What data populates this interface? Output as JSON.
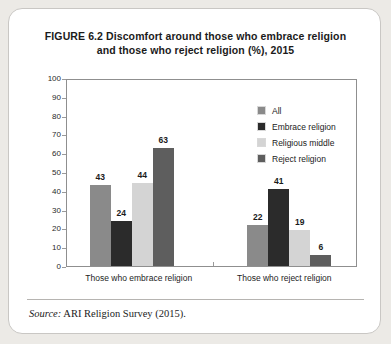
{
  "figure": {
    "title_line1": "FIGURE 6.2  Discomfort around those who embrace religion",
    "title_line2": "and those who reject religion (%), 2015",
    "source_label": "Source:",
    "source_text": " ARI Religion Survey (2015)."
  },
  "chart_data": {
    "type": "bar",
    "title": "FIGURE 6.2  Discomfort around those who embrace religion and those who reject religion (%), 2015",
    "xlabel": "",
    "ylabel": "",
    "ylim": [
      0,
      100
    ],
    "yticks": [
      0,
      10,
      20,
      30,
      40,
      50,
      60,
      70,
      80,
      90,
      100
    ],
    "grid": false,
    "legend_position": "inside-top-right",
    "categories": [
      "Those who embrace religion",
      "Those who reject religion"
    ],
    "series": [
      {
        "name": "All",
        "color": "#8a8a8a",
        "values": [
          43,
          22
        ]
      },
      {
        "name": "Embrace religion",
        "color": "#2b2b2b",
        "values": [
          24,
          41
        ]
      },
      {
        "name": "Religious middle",
        "color": "#d4d4d4",
        "values": [
          44,
          19
        ]
      },
      {
        "name": "Reject religion",
        "color": "#5e5e5e",
        "values": [
          63,
          6
        ]
      }
    ]
  }
}
